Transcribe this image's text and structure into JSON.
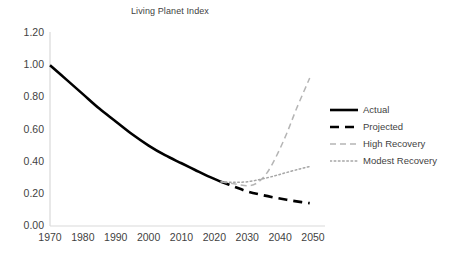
{
  "chart_data": {
    "type": "line",
    "title": "Living Planet Index",
    "xlabel": "",
    "ylabel": "",
    "xlim": [
      1970,
      2050
    ],
    "ylim": [
      0.0,
      1.2
    ],
    "grid": false,
    "legend_position": "right",
    "x_ticks": [
      "1970",
      "1980",
      "1990",
      "2000",
      "2010",
      "2020",
      "2030",
      "2040",
      "2050"
    ],
    "x_tick_values": [
      1970,
      1980,
      1990,
      2000,
      2010,
      2020,
      2030,
      2040,
      2050
    ],
    "y_ticks": [
      "0.00",
      "0.20",
      "0.40",
      "0.60",
      "0.80",
      "1.00",
      "1.20"
    ],
    "y_tick_values": [
      0.0,
      0.2,
      0.4,
      0.6,
      0.8,
      1.0,
      1.2
    ],
    "series": [
      {
        "name": "Actual",
        "style": "solid",
        "color": "#000000",
        "width": 2.6,
        "x": [
          1970,
          1975,
          1980,
          1985,
          1990,
          1995,
          2000,
          2005,
          2010,
          2014,
          2018,
          2022
        ],
        "values": [
          1.0,
          0.91,
          0.82,
          0.73,
          0.65,
          0.57,
          0.5,
          0.44,
          0.39,
          0.35,
          0.31,
          0.275
        ]
      },
      {
        "name": "Projected",
        "style": "dashed",
        "color": "#000000",
        "width": 2.6,
        "x": [
          2022,
          2026,
          2030,
          2034,
          2038,
          2042,
          2046,
          2049
        ],
        "values": [
          0.275,
          0.245,
          0.215,
          0.195,
          0.178,
          0.163,
          0.15,
          0.142
        ]
      },
      {
        "name": "High Recovery",
        "style": "dashed",
        "color": "#b5b5b5",
        "width": 1.5,
        "x": [
          2022,
          2026,
          2030,
          2033,
          2036,
          2039,
          2042,
          2045,
          2049
        ],
        "values": [
          0.275,
          0.262,
          0.25,
          0.268,
          0.33,
          0.44,
          0.575,
          0.73,
          0.92
        ]
      },
      {
        "name": "Modest Recovery",
        "style": "dotted",
        "color": "#a6a6a6",
        "width": 1.5,
        "x": [
          2022,
          2026,
          2030,
          2034,
          2038,
          2042,
          2046,
          2049
        ],
        "values": [
          0.275,
          0.272,
          0.275,
          0.29,
          0.31,
          0.333,
          0.355,
          0.37
        ]
      }
    ]
  },
  "legend": {
    "items": [
      {
        "label": "Actual"
      },
      {
        "label": "Projected"
      },
      {
        "label": "High Recovery"
      },
      {
        "label": "Modest Recovery"
      }
    ]
  },
  "axis_color": "#d9d9d9"
}
